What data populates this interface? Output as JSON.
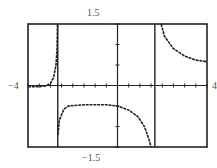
{
  "chart_data": {
    "type": "line",
    "title": "",
    "xlabel": "",
    "ylabel": "",
    "xlim": [
      -4,
      4
    ],
    "ylim": [
      -1.5,
      1.5
    ],
    "grid": false,
    "x_tick_count": 16,
    "y_ticks_count": 6,
    "vertical_asymptotes": [
      -2.67,
      1.67
    ],
    "labels": {
      "xmin": "−4",
      "xmax": "4",
      "ymax": "1.5",
      "ymin": "−1.5"
    },
    "series": [
      {
        "name": "left branch",
        "points": [
          [
            -4,
            -0.03
          ],
          [
            -3.5,
            -0.03
          ],
          [
            -3.2,
            -0.01
          ],
          [
            -3.0,
            0.05
          ],
          [
            -2.85,
            0.2
          ],
          [
            -2.75,
            0.5
          ],
          [
            -2.7,
            0.9
          ],
          [
            -2.68,
            1.5
          ]
        ]
      },
      {
        "name": "middle branch",
        "points": [
          [
            -2.66,
            -1.2
          ],
          [
            -2.6,
            -0.85
          ],
          [
            -2.4,
            -0.58
          ],
          [
            -2.2,
            -0.5
          ],
          [
            -1.5,
            -0.47
          ],
          [
            -0.5,
            -0.47
          ],
          [
            0,
            -0.5
          ],
          [
            0.5,
            -0.6
          ],
          [
            0.9,
            -0.75
          ],
          [
            1.2,
            -1.0
          ],
          [
            1.4,
            -1.3
          ],
          [
            1.5,
            -1.5
          ]
        ]
      },
      {
        "name": "right branch",
        "points": [
          [
            1.95,
            1.5
          ],
          [
            2.1,
            1.2
          ],
          [
            2.5,
            0.9
          ],
          [
            3.0,
            0.72
          ],
          [
            3.5,
            0.62
          ],
          [
            4.0,
            0.58
          ]
        ]
      }
    ]
  }
}
